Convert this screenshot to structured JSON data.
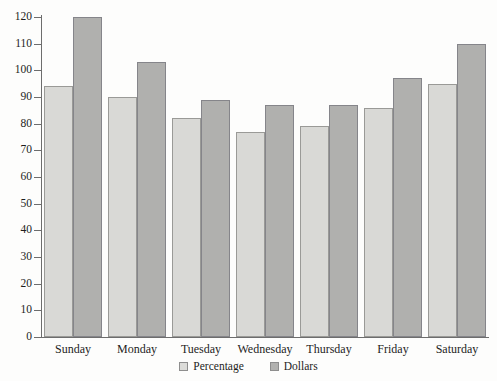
{
  "chart_data": {
    "type": "bar",
    "title": "",
    "subtitle": "",
    "xlabel": "",
    "ylabel": "",
    "categories": [
      "Sunday",
      "Monday",
      "Tuesday",
      "Wednesday",
      "Thursday",
      "Friday",
      "Saturday"
    ],
    "series": [
      {
        "name": "Percentage",
        "color": "#d9d9d6",
        "values": [
          94,
          90,
          82,
          77,
          79,
          86,
          95
        ]
      },
      {
        "name": "Dollars",
        "color": "#b0b0ae",
        "values": [
          120,
          103,
          89,
          87,
          87,
          97,
          110
        ]
      }
    ],
    "ylim": [
      0,
      120
    ],
    "ytick_step": 10,
    "yticks": [
      0,
      10,
      20,
      30,
      40,
      50,
      60,
      70,
      80,
      90,
      100,
      110,
      120
    ],
    "ytick_labels": [
      "0",
      "10",
      "20",
      "30",
      "40",
      "50",
      "60",
      "70",
      "80",
      "90",
      "100",
      "110",
      "120"
    ],
    "grid": false,
    "legend_position": "bottom",
    "axis_frame": "left-and-bottom"
  },
  "legend": {
    "items": [
      {
        "label": "Percentage",
        "swatch": "percentage-swatch-icon"
      },
      {
        "label": "Dollars",
        "swatch": "dollars-swatch-icon"
      }
    ]
  }
}
